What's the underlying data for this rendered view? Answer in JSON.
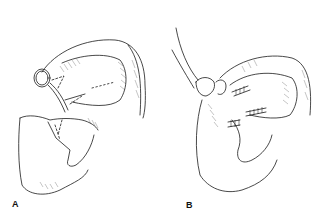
{
  "figure": {
    "panels": [
      {
        "id": "A",
        "label": "A",
        "description": "Surgical illustration: organ with vascular pedicle and loop, dashed incision lines, lower organ segment separated"
      },
      {
        "id": "B",
        "label": "B",
        "description": "Surgical illustration: segments rejoined with sutured anastomoses, tube/ureter entering at upper left"
      }
    ],
    "colors": {
      "ink": "#1a1a1a",
      "background": "#ffffff"
    }
  }
}
